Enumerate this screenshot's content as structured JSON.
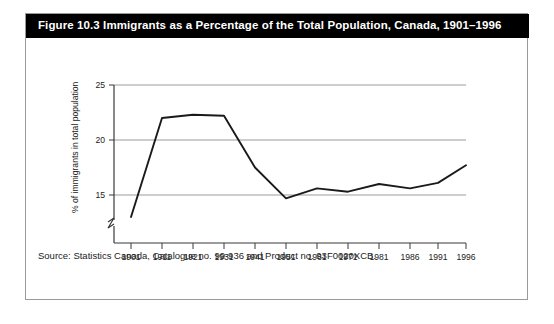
{
  "figure": {
    "title": "Figure 10.3 Immigrants as a Percentage of the Total Population, Canada, 1901–1996",
    "source": "Source: Statistics Canada, Catalogue no. 99-936 and Product no. 93F0020XCB.",
    "border_color": "#9a9a9a",
    "title_bar_color": "#000000",
    "title_text_color": "#ffffff"
  },
  "chart_data": {
    "type": "line",
    "title": "Figure 10.3 Immigrants as a Percentage of the Total Population, Canada, 1901–1996",
    "xlabel": "",
    "ylabel": "% of immigrants in total population",
    "categories": [
      "1901",
      "1911",
      "1921",
      "1931",
      "1941",
      "1951",
      "1961",
      "1971",
      "1981",
      "1986",
      "1991",
      "1996"
    ],
    "values": [
      13.0,
      22.0,
      22.3,
      22.2,
      17.5,
      14.7,
      15.6,
      15.3,
      16.0,
      15.6,
      16.1,
      17.7
    ],
    "ylim": [
      12.5,
      25.0
    ],
    "yticks": [
      15,
      20,
      25
    ],
    "ytick_labels": [
      "15",
      "20",
      "25"
    ],
    "axis_break": true,
    "axis_break_note": "y-axis broken below 15",
    "grid": "horizontal",
    "legend": "none",
    "line_color": "#1a1a1a",
    "grid_color": "#9b9b9b",
    "axis_color": "#3a3a3a"
  }
}
